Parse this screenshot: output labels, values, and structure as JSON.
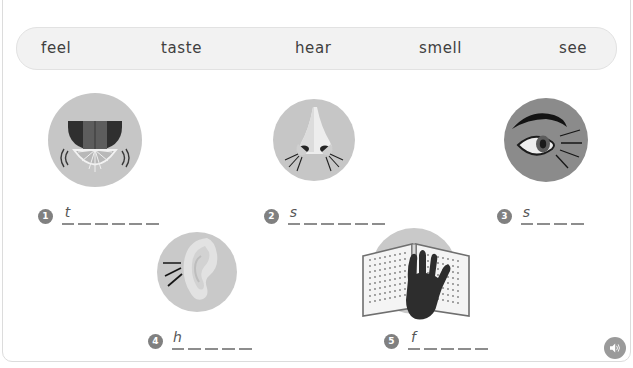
{
  "instruction": {
    "text": "Write the words."
  },
  "word_bank": {
    "name": "word-bank",
    "background": "#f2f2f2",
    "border": "#e2e2e2",
    "words": [
      {
        "label": "feel",
        "x": 40
      },
      {
        "label": "taste",
        "x": 160
      },
      {
        "label": "hear",
        "x": 294
      },
      {
        "label": "smell",
        "x": 418
      },
      {
        "label": "see",
        "x": 558
      }
    ]
  },
  "items": [
    {
      "number": "1",
      "icon": "mouth-tongue-lemon-icon",
      "answer_word": "taste",
      "given_letter": "t",
      "blank_count": 5,
      "circle_color": "#c6c6c6",
      "circle_size": 94,
      "pic_x": 48,
      "pic_y": 93,
      "row_x": 38,
      "row_y": 205
    },
    {
      "number": "2",
      "icon": "nose-icon",
      "answer_word": "smell",
      "given_letter": "s",
      "blank_count": 5,
      "circle_color": "#c6c6c6",
      "circle_size": 82,
      "pic_x": 273,
      "pic_y": 99,
      "row_x": 264,
      "row_y": 205
    },
    {
      "number": "3",
      "icon": "eye-icon",
      "answer_word": "see",
      "given_letter": "s",
      "blank_count": 3,
      "circle_color": "#8b8b8b",
      "circle_size": 84,
      "pic_x": 504,
      "pic_y": 98,
      "row_x": 497,
      "row_y": 205
    },
    {
      "number": "4",
      "icon": "ear-icon",
      "answer_word": "hear",
      "given_letter": "h",
      "blank_count": 4,
      "circle_color": "#c9c9c9",
      "circle_size": 80,
      "pic_x": 157,
      "pic_y": 232,
      "row_x": 148,
      "row_y": 330
    },
    {
      "number": "5",
      "icon": "hand-braille-book-icon",
      "answer_word": "feel",
      "given_letter": "f",
      "blank_count": 4,
      "circle_color": "#c9c9c9",
      "circle_size": 86,
      "pic_x": 371,
      "pic_y": 228,
      "row_x": 384,
      "row_y": 330
    }
  ],
  "audio": {
    "name": "audio-play-button",
    "icon": "speaker-icon",
    "color": "#9a9a9a"
  },
  "colors": {
    "page_background": "#ffffff",
    "frame_border": "#dcdcdc",
    "blank_line": "#8d8d8d",
    "badge": "#808080",
    "text": "#3f3f3f"
  }
}
